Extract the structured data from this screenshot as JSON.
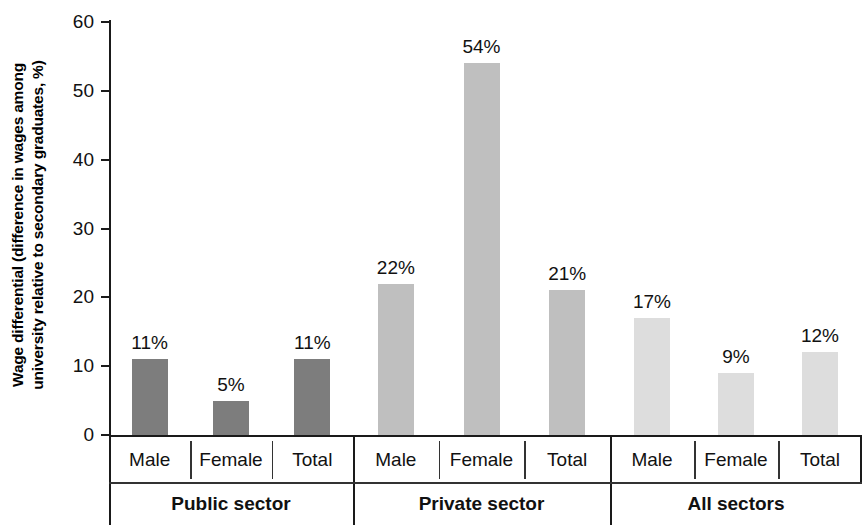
{
  "chart_data": {
    "type": "bar",
    "title": "",
    "xlabel": "",
    "ylabel": "Wage differential (difference in wages among university relative to secondary graduates, %)",
    "ylabel_line1": "Wage differential (difference in wages among",
    "ylabel_line2": "university relative to secondary graduates, %)",
    "ylim": [
      0,
      60
    ],
    "yticks": [
      0,
      10,
      20,
      30,
      40,
      50,
      60
    ],
    "ytick_labels": [
      "0",
      "10",
      "20",
      "30",
      "40",
      "50",
      "60"
    ],
    "grid": false,
    "legend": "none",
    "categories": [
      "Male",
      "Female",
      "Total",
      "Male",
      "Female",
      "Total",
      "Male",
      "Female",
      "Total"
    ],
    "values": [
      11,
      5,
      11,
      22,
      54,
      21,
      17,
      9,
      12
    ],
    "data_labels": [
      "11%",
      "5%",
      "11%",
      "22%",
      "54%",
      "21%",
      "17%",
      "9%",
      "12%"
    ],
    "groups": [
      {
        "name": "Public sector",
        "color": "#7d7d7d",
        "bars": [
          {
            "category": "Male",
            "value": 11,
            "label": "11%"
          },
          {
            "category": "Female",
            "value": 5,
            "label": "5%"
          },
          {
            "category": "Total",
            "value": 11,
            "label": "11%"
          }
        ]
      },
      {
        "name": "Private sector",
        "color": "#bfbfbf",
        "bars": [
          {
            "category": "Male",
            "value": 22,
            "label": "22%"
          },
          {
            "category": "Female",
            "value": 54,
            "label": "54%"
          },
          {
            "category": "Total",
            "value": 21,
            "label": "21%"
          }
        ]
      },
      {
        "name": "All sectors",
        "color": "#dddddd",
        "bars": [
          {
            "category": "Male",
            "value": 17,
            "label": "17%"
          },
          {
            "category": "Female",
            "value": 9,
            "label": "9%"
          },
          {
            "category": "Total",
            "value": 12,
            "label": "12%"
          }
        ]
      }
    ]
  }
}
